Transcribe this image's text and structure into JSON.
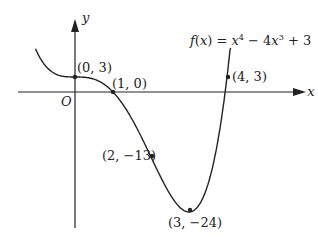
{
  "diagram": {
    "function_label": "f(x) = x⁴ − 4x³ + 3",
    "function_parts": {
      "f": "f",
      "x": "x",
      "eq": ") = ",
      "t1": "x",
      "p1": "4",
      "t2": " − 4",
      "t3": "x",
      "p2": "3",
      "t4": " + 3"
    },
    "axes": {
      "x_label": "x",
      "y_label": "y",
      "origin_label": "O"
    },
    "points": [
      {
        "label": "(0, 3)",
        "x": 0,
        "y": 3
      },
      {
        "label": "(1, 0)",
        "x": 1,
        "y": 0
      },
      {
        "label": "(2, −13)",
        "x": 2,
        "y": -13
      },
      {
        "label": "(3, −24)",
        "x": 3,
        "y": -24
      },
      {
        "label": "(4, 3)",
        "x": 4,
        "y": 3
      }
    ],
    "colors": {
      "curve": "#222222",
      "axes": "#222222"
    }
  }
}
